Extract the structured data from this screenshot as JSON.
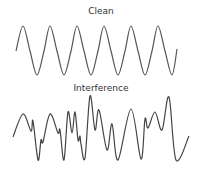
{
  "diagram": {
    "panels": [
      {
        "title": "Clean",
        "description": "regular sine wave, six cycles",
        "stroke": "#555555",
        "points": [
          [
            16,
            51
          ],
          [
            23,
            26
          ],
          [
            30,
            51
          ],
          [
            37,
            75
          ],
          [
            44,
            51
          ],
          [
            50,
            26
          ],
          [
            57,
            51
          ],
          [
            64,
            75
          ],
          [
            71,
            51
          ],
          [
            77,
            26
          ],
          [
            84,
            51
          ],
          [
            91,
            75
          ],
          [
            98,
            51
          ],
          [
            104,
            26
          ],
          [
            111,
            51
          ],
          [
            118,
            75
          ],
          [
            125,
            51
          ],
          [
            131,
            26
          ],
          [
            138,
            51
          ],
          [
            145,
            75
          ],
          [
            152,
            51
          ],
          [
            158,
            26
          ],
          [
            165,
            51
          ],
          [
            172,
            75
          ],
          [
            177,
            49
          ]
        ]
      },
      {
        "title": "Interference",
        "description": "irregular distorted wave",
        "stroke": "#444444",
        "points": [
          [
            13,
            137
          ],
          [
            23,
            114
          ],
          [
            31,
            131
          ],
          [
            33,
            121
          ],
          [
            38,
            160
          ],
          [
            41,
            140
          ],
          [
            43,
            142
          ],
          [
            50,
            114
          ],
          [
            58,
            133
          ],
          [
            60,
            130
          ],
          [
            64,
            160
          ],
          [
            68,
            112
          ],
          [
            72,
            133
          ],
          [
            75,
            112
          ],
          [
            78,
            140
          ],
          [
            80,
            136
          ],
          [
            81,
            144
          ],
          [
            85,
            158
          ],
          [
            90,
            96
          ],
          [
            95,
            130
          ],
          [
            99,
            110
          ],
          [
            107,
            150
          ],
          [
            112,
            124
          ],
          [
            118,
            160
          ],
          [
            131,
            109
          ],
          [
            141,
            159
          ],
          [
            145,
            119
          ],
          [
            148,
            128
          ],
          [
            155,
            112
          ],
          [
            162,
            130
          ],
          [
            169,
            97
          ],
          [
            176,
            160
          ],
          [
            189,
            136
          ]
        ]
      }
    ]
  }
}
